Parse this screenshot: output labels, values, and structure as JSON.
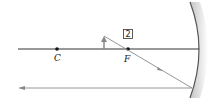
{
  "diagram": {
    "type": "concave-mirror-ray-diagram",
    "points": [
      {
        "id": "center-of-curvature",
        "label": "C"
      },
      {
        "id": "focal-point",
        "label": "F"
      }
    ],
    "step_label": "2",
    "colors": {
      "axis": "#333333",
      "ray": "#8a8a8a",
      "mirror": "#555555",
      "mirror_shade": "#cfcfcf",
      "object": "#888888"
    }
  }
}
